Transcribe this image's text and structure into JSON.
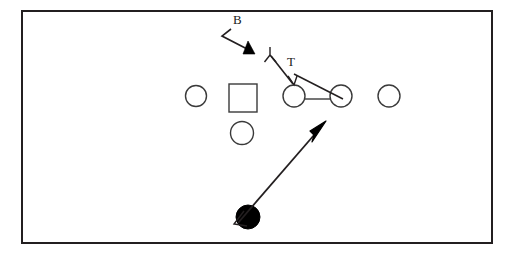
{
  "figure": {
    "kind": "football-play-diagram",
    "background_color": "#ffffff",
    "stroke_color": "#231f20",
    "fill_color": "#000000",
    "frame": {
      "x": 21,
      "y": 10,
      "width": 472,
      "height": 234,
      "border_width": 2
    }
  },
  "labels": {
    "blocker": "B",
    "target": "T"
  },
  "players": {
    "offensive_line": [
      {
        "name": "lineman-1",
        "shape": "circle",
        "cx": 196,
        "cy": 96,
        "r": 10.5
      },
      {
        "name": "lineman-2",
        "shape": "square",
        "x": 229,
        "y": 84,
        "size": 28
      },
      {
        "name": "lineman-3",
        "shape": "circle",
        "cx": 294,
        "cy": 96,
        "r": 11
      },
      {
        "name": "lineman-4",
        "shape": "circle",
        "cx": 341,
        "cy": 96,
        "r": 11
      },
      {
        "name": "lineman-5",
        "shape": "circle",
        "cx": 389,
        "cy": 96,
        "r": 11
      }
    ],
    "backfield": [
      {
        "name": "back-player",
        "shape": "circle",
        "cx": 242,
        "cy": 133,
        "r": 11.5
      }
    ],
    "ball_carrier": {
      "name": "ball-carrier",
      "shape": "filled-circle",
      "cx": 248,
      "cy": 217,
      "r": 12
    }
  },
  "marks": {
    "defender_triangle": {
      "name": "defender-marker",
      "points": "253,52 245,52 249,41"
    },
    "fork_mark": {
      "name": "fork-mark",
      "stem": [
        270,
        47,
        270,
        55
      ],
      "left": [
        270,
        55,
        265,
        61
      ],
      "right": [
        270,
        55,
        276,
        61
      ]
    },
    "connector_line": {
      "name": "line-connector",
      "from": [
        305,
        99
      ],
      "to": [
        330,
        99
      ]
    }
  },
  "paths": {
    "blocker_path": {
      "name": "blocker-path",
      "polyline": "231,29 222,36 251,52",
      "arrowhead": "filled-triangle"
    },
    "target_path": {
      "name": "target-path",
      "polyline": "271,55 294,85",
      "arrowhead": "open-v"
    },
    "secondary_target_path": {
      "name": "target-path-secondary",
      "polyline": "294,73 341,96",
      "arrowhead": "none"
    },
    "ball_path": {
      "name": "ball-carrier-path",
      "polyline": "236,224 324,124",
      "arrowhead_start": "small-open",
      "arrowhead_end": "large-filled"
    }
  },
  "label_positions": {
    "blocker": {
      "x": 233,
      "y": 24
    },
    "target": {
      "x": 287,
      "y": 66
    }
  }
}
